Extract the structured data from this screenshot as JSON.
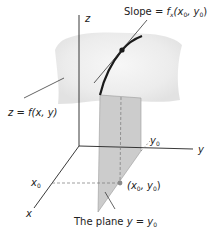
{
  "diagram": {
    "labels": {
      "slope_prefix": "Slope = ",
      "slope_func": "f",
      "slope_sub": "x",
      "slope_args_open": "(x",
      "slope_args_sub0": "0",
      "slope_args_mid": ", y",
      "slope_args_sub1": "0",
      "slope_args_close": ")",
      "z_axis": "z",
      "y_axis": "y",
      "x_axis": "x",
      "surface": "z = f(x, y)",
      "x0_main": "x",
      "x0_sub": "0",
      "y0_main": "y",
      "y0_sub": "0",
      "point_open": "(x",
      "point_sub0": "0",
      "point_mid": ", y",
      "point_sub1": "0",
      "point_close": ")",
      "plane_prefix": "The plane ",
      "plane_eq_main": "y = y",
      "plane_eq_sub": "0"
    },
    "colors": {
      "surface": "#ececec",
      "plane": "#c9c9c9",
      "axis": "#222222",
      "curve": "#1a1a1a",
      "point_base": "#8a8a8a"
    }
  }
}
